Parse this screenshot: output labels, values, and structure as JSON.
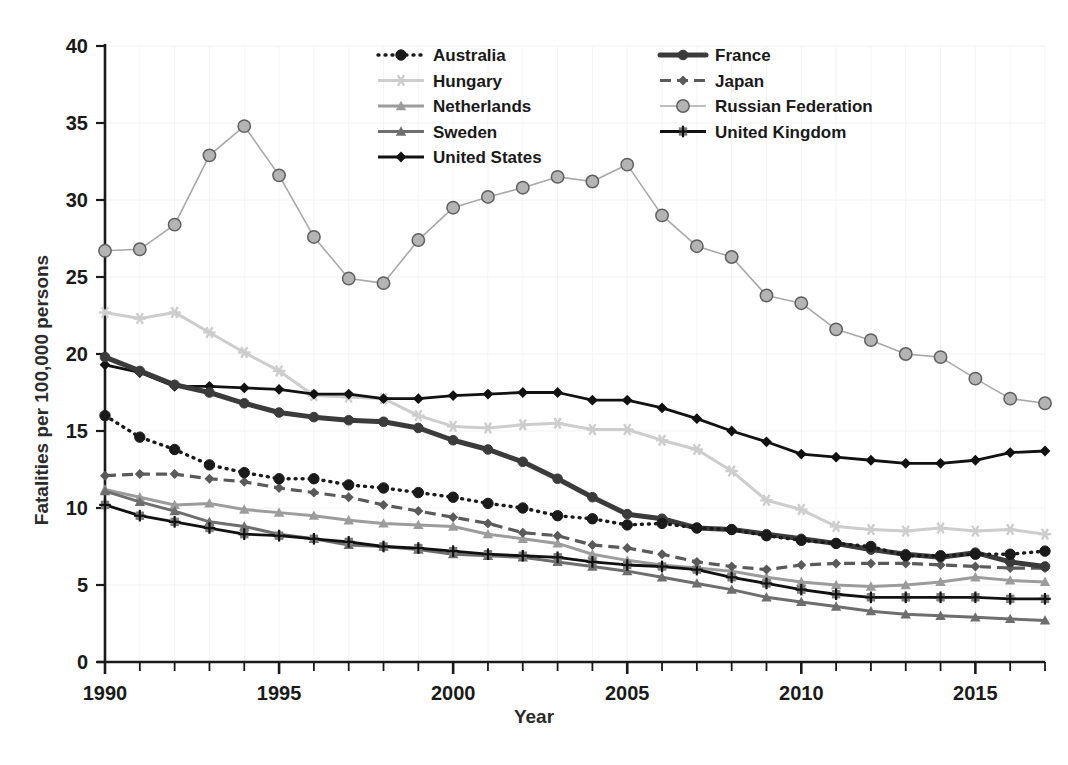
{
  "chart_data": {
    "type": "line",
    "title": "",
    "xlabel": "Year",
    "ylabel": "Fatalities per 100,000 persons",
    "xlim": [
      1990,
      2017
    ],
    "ylim": [
      0,
      40
    ],
    "yticks": [
      0,
      5,
      10,
      15,
      20,
      25,
      30,
      35,
      40
    ],
    "xticks_major": [
      1990,
      1995,
      2000,
      2005,
      2010,
      2015
    ],
    "xticks_minor_step": 1,
    "grid": "faint",
    "legend_position": "top-center",
    "x": [
      1990,
      1991,
      1992,
      1993,
      1994,
      1995,
      1996,
      1997,
      1998,
      1999,
      2000,
      2001,
      2002,
      2003,
      2004,
      2005,
      2006,
      2007,
      2008,
      2009,
      2010,
      2011,
      2012,
      2013,
      2014,
      2015,
      2016,
      2017
    ],
    "series": [
      {
        "name": "Australia",
        "color": "#1a1a1a",
        "line_style": "dotted",
        "marker": "circle",
        "values": [
          16.0,
          14.6,
          13.8,
          12.8,
          12.3,
          11.9,
          11.9,
          11.5,
          11.3,
          11.0,
          10.7,
          10.3,
          10.0,
          9.5,
          9.3,
          8.9,
          9.0,
          8.7,
          8.6,
          8.2,
          7.9,
          7.7,
          7.5,
          6.9,
          6.9,
          7.0,
          7.0,
          7.2
        ]
      },
      {
        "name": "Hungary",
        "color": "#cdcdcd",
        "line_style": "solid",
        "marker": "asterisk",
        "values": [
          22.7,
          22.3,
          22.7,
          21.4,
          20.1,
          18.9,
          17.3,
          17.2,
          17.1,
          16.0,
          15.3,
          15.2,
          15.4,
          15.5,
          15.1,
          15.1,
          14.4,
          13.8,
          12.4,
          10.5,
          9.9,
          8.8,
          8.6,
          8.5,
          8.7,
          8.5,
          8.6,
          8.3
        ]
      },
      {
        "name": "Netherlands",
        "color": "#9c9c9c",
        "line_style": "solid",
        "marker": "triangle",
        "values": [
          11.2,
          10.7,
          10.2,
          10.3,
          9.9,
          9.7,
          9.5,
          9.2,
          9.0,
          8.9,
          8.8,
          8.3,
          8.0,
          7.7,
          7.0,
          6.6,
          6.3,
          6.1,
          5.9,
          5.5,
          5.2,
          5.0,
          4.9,
          5.0,
          5.2,
          5.5,
          5.3,
          5.2
        ]
      },
      {
        "name": "Sweden",
        "color": "#6e6e6e",
        "line_style": "solid",
        "marker": "triangle",
        "values": [
          11.1,
          10.4,
          9.8,
          9.1,
          8.8,
          8.3,
          8.0,
          7.6,
          7.5,
          7.3,
          7.0,
          6.9,
          6.8,
          6.5,
          6.2,
          5.9,
          5.5,
          5.1,
          4.7,
          4.2,
          3.9,
          3.6,
          3.3,
          3.1,
          3.0,
          2.9,
          2.8,
          2.7
        ]
      },
      {
        "name": "United States",
        "color": "#111111",
        "line_style": "solid",
        "marker": "diamond",
        "values": [
          19.3,
          18.8,
          17.9,
          17.9,
          17.8,
          17.7,
          17.4,
          17.4,
          17.1,
          17.1,
          17.3,
          17.4,
          17.5,
          17.5,
          17.0,
          17.0,
          16.5,
          15.8,
          15.0,
          14.3,
          13.5,
          13.3,
          13.1,
          12.9,
          12.9,
          13.1,
          13.6,
          13.7
        ]
      },
      {
        "name": "France",
        "color": "#3b3b3b",
        "line_style": "solid-thick",
        "marker": "circle",
        "values": [
          19.8,
          18.9,
          18.0,
          17.5,
          16.8,
          16.2,
          15.9,
          15.7,
          15.6,
          15.2,
          14.4,
          13.8,
          13.0,
          11.9,
          10.7,
          9.6,
          9.3,
          8.7,
          8.6,
          8.3,
          8.0,
          7.7,
          7.3,
          7.0,
          6.8,
          7.1,
          6.5,
          6.2
        ]
      },
      {
        "name": "Japan",
        "color": "#5a5a5a",
        "line_style": "dashed",
        "marker": "diamond",
        "values": [
          12.1,
          12.2,
          12.2,
          11.9,
          11.7,
          11.3,
          11.0,
          10.7,
          10.2,
          9.8,
          9.4,
          9.0,
          8.4,
          8.2,
          7.6,
          7.4,
          7.0,
          6.5,
          6.2,
          6.0,
          6.3,
          6.4,
          6.4,
          6.4,
          6.3,
          6.2,
          6.1,
          6.1
        ]
      },
      {
        "name": "Russian Federation",
        "color": "#a8a8a8",
        "line_style": "solid",
        "marker": "circle-open",
        "values": [
          26.7,
          26.8,
          28.4,
          32.9,
          34.8,
          31.6,
          27.6,
          24.9,
          24.6,
          27.4,
          29.5,
          30.2,
          30.8,
          31.5,
          31.2,
          32.3,
          29.0,
          27.0,
          26.3,
          23.8,
          23.3,
          21.6,
          20.9,
          20.0,
          19.8,
          18.4,
          17.1,
          16.8
        ]
      },
      {
        "name": "United Kingdom",
        "color": "#111111",
        "line_style": "solid",
        "marker": "plus-square",
        "values": [
          10.2,
          9.5,
          9.1,
          8.7,
          8.3,
          8.2,
          8.0,
          7.8,
          7.5,
          7.4,
          7.2,
          7.0,
          6.9,
          6.8,
          6.5,
          6.3,
          6.2,
          6.0,
          5.5,
          5.1,
          4.7,
          4.4,
          4.2,
          4.2,
          4.2,
          4.2,
          4.1,
          4.1
        ]
      }
    ],
    "legend_order": [
      "Australia",
      "France",
      "Hungary",
      "Japan",
      "Netherlands",
      "Russian Federation",
      "Sweden",
      "United Kingdom",
      "United States"
    ]
  }
}
